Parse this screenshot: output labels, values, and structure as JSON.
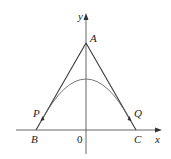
{
  "diagram": {
    "axes": {
      "x_label": "x",
      "y_label": "y",
      "origin_label": "0"
    },
    "points": {
      "A": "A",
      "B": "B",
      "C": "C",
      "P": "P",
      "Q": "Q"
    },
    "colors": {
      "line": "#3a3a3a",
      "axis": "#555555",
      "curve": "#555555",
      "text": "#222222"
    },
    "elements": [
      "triangle-side-AB",
      "triangle-side-AC",
      "parabola-tangent-at-P-and-Q",
      "x-axis",
      "y-axis"
    ]
  }
}
